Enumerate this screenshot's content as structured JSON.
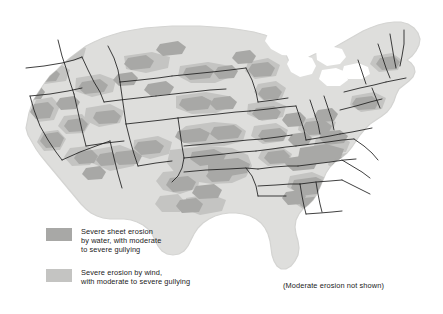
{
  "map": {
    "title": "Soil erosion in the contiguous United States",
    "region": "Contiguous United States",
    "background_color": "#ffffff",
    "land_color": "#dededc",
    "land_edge_color": "#d2d2d0",
    "state_border_color": "#1d1d1d",
    "water_color": "#ffffff",
    "water_erosion_color": "#a8a8a6",
    "wind_erosion_color": "#c4c4c2",
    "states": [
      "Washington",
      "Oregon",
      "California",
      "Nevada",
      "Idaho",
      "Montana",
      "Wyoming",
      "Utah",
      "Arizona",
      "Colorado",
      "New Mexico",
      "North Dakota",
      "South Dakota",
      "Nebraska",
      "Kansas",
      "Oklahoma",
      "Texas",
      "Minnesota",
      "Iowa",
      "Missouri",
      "Arkansas",
      "Louisiana",
      "Wisconsin",
      "Illinois",
      "Michigan",
      "Indiana",
      "Ohio",
      "Kentucky",
      "Tennessee",
      "Mississippi",
      "Alabama",
      "Georgia",
      "Florida",
      "South Carolina",
      "North Carolina",
      "Virginia",
      "West Virginia",
      "Maryland",
      "Delaware",
      "Pennsylvania",
      "New Jersey",
      "New York",
      "Connecticut",
      "Rhode Island",
      "Massachusetts",
      "Vermont",
      "New Hampshire",
      "Maine"
    ]
  },
  "legend": {
    "entries": [
      {
        "swatch_name": "water-erosion-swatch",
        "color": "#a8a8a6",
        "label": "Severe sheet erosion\nby water, with moderate\nto severe gullying"
      },
      {
        "swatch_name": "wind-erosion-swatch",
        "color": "#c4c4c2",
        "label": "Severe erosion by wind,\nwith moderate to severe gullying"
      }
    ]
  },
  "note": {
    "text": "(Moderate erosion not shown)"
  }
}
